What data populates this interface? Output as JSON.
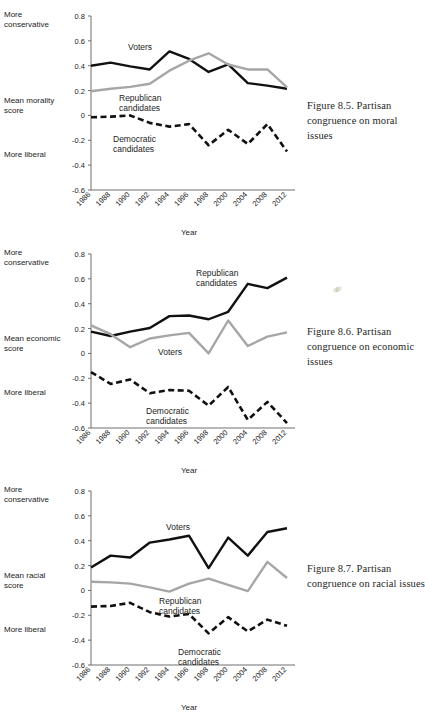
{
  "figures": [
    {
      "id": "figure-8-5",
      "caption": "Figure 8.5.  Partisan congruence on moral issues",
      "axis": {
        "top_label": "More conservative",
        "mid_label": "Mean morality score",
        "bottom_label": "More liberal",
        "x_title": "Year",
        "y_ticks": [
          "0.8",
          "0.6",
          "0.4",
          "0.2",
          "0",
          "-0.2",
          "-0.4",
          "-0.6"
        ]
      },
      "annotations": [
        {
          "text": "Voters"
        },
        {
          "text": "Republican"
        },
        {
          "text": "candidates"
        },
        {
          "text": "Democratic"
        },
        {
          "text": "candidates"
        }
      ],
      "chart_data": {
        "type": "line",
        "title": "Figure 8.5. Partisan congruence on moral issues",
        "xlabel": "Year",
        "ylabel": "Mean morality score",
        "ylim": [
          -0.6,
          0.8
        ],
        "grid": false,
        "legend": "inline-annotations",
        "categories": [
          "1986",
          "1988",
          "1990",
          "1992",
          "1994",
          "1996",
          "1998",
          "2000",
          "2004",
          "2008",
          "2012"
        ],
        "series": [
          {
            "name": "Voters",
            "color": "#111111",
            "style": "solid",
            "values": [
              0.4,
              0.425,
              0.395,
              0.37,
              0.515,
              0.455,
              0.35,
              0.41,
              0.26,
              0.24,
              0.215
            ]
          },
          {
            "name": "Republican candidates",
            "color": "#a6a6a6",
            "style": "solid",
            "values": [
              0.195,
              0.215,
              0.23,
              0.255,
              0.36,
              0.44,
              0.5,
              0.41,
              0.37,
              0.37,
              0.225
            ]
          },
          {
            "name": "Democratic candidates",
            "color": "#111111",
            "style": "dashed",
            "values": [
              -0.015,
              -0.01,
              0.0,
              -0.06,
              -0.09,
              -0.07,
              -0.24,
              -0.115,
              -0.23,
              -0.07,
              -0.29
            ]
          }
        ]
      }
    },
    {
      "id": "figure-8-6",
      "caption": "Figure 8.6.  Partisan congruence on economic issues",
      "axis": {
        "top_label": "More conservative",
        "mid_label": "Mean economic score",
        "bottom_label": "More liberal",
        "x_title": "Year",
        "y_ticks": [
          "0.8",
          "0.6",
          "0.4",
          "0.2",
          "0",
          "-0.2",
          "-0.4",
          "-0.6"
        ]
      },
      "annotations": [
        {
          "text": "Republican"
        },
        {
          "text": "candidates"
        },
        {
          "text": "Voters"
        },
        {
          "text": "Democratic"
        },
        {
          "text": "candidates"
        }
      ],
      "chart_data": {
        "type": "line",
        "title": "Figure 8.6. Partisan congruence on economic issues",
        "xlabel": "Year",
        "ylabel": "Mean economic score",
        "ylim": [
          -0.6,
          0.8
        ],
        "grid": false,
        "legend": "inline-annotations",
        "categories": [
          "1986",
          "1988",
          "1990",
          "1992",
          "1994",
          "1996",
          "1998",
          "2000",
          "2004",
          "2008",
          "2012"
        ],
        "series": [
          {
            "name": "Republican candidates",
            "color": "#111111",
            "style": "solid",
            "values": [
              0.175,
              0.14,
              0.175,
              0.205,
              0.3,
              0.305,
              0.275,
              0.335,
              0.56,
              0.525,
              0.61
            ]
          },
          {
            "name": "Voters",
            "color": "#a6a6a6",
            "style": "solid",
            "values": [
              0.225,
              0.155,
              0.05,
              0.12,
              0.145,
              0.165,
              0.0,
              0.265,
              0.06,
              0.135,
              0.17
            ]
          },
          {
            "name": "Democratic candidates",
            "color": "#111111",
            "style": "dashed",
            "values": [
              -0.15,
              -0.245,
              -0.21,
              -0.32,
              -0.295,
              -0.3,
              -0.42,
              -0.27,
              -0.535,
              -0.39,
              -0.56
            ]
          }
        ]
      }
    },
    {
      "id": "figure-8-7",
      "caption": "Figure 8.7.  Partisan congruence on racial issues",
      "axis": {
        "top_label": "More conservative",
        "mid_label": "Mean racial score",
        "bottom_label": "More liberal",
        "x_title": "Year",
        "y_ticks": [
          "0.8",
          "0.6",
          "0.4",
          "0.2",
          "0",
          "-0.2",
          "-0.4",
          "-0.6"
        ]
      },
      "annotations": [
        {
          "text": "Voters"
        },
        {
          "text": "Republican"
        },
        {
          "text": "candidates"
        },
        {
          "text": "Democratic"
        },
        {
          "text": "candidates"
        }
      ],
      "chart_data": {
        "type": "line",
        "title": "Figure 8.7. Partisan congruence on racial issues",
        "xlabel": "Year",
        "ylabel": "Mean racial score",
        "ylim": [
          -0.6,
          0.8
        ],
        "grid": false,
        "legend": "inline-annotations",
        "categories": [
          "1986",
          "1988",
          "1990",
          "1992",
          "1994",
          "1996",
          "1998",
          "2000",
          "2004",
          "2008",
          "2012"
        ],
        "series": [
          {
            "name": "Voters",
            "color": "#111111",
            "style": "solid",
            "values": [
              0.185,
              0.28,
              0.265,
              0.385,
              0.41,
              0.44,
              0.18,
              0.425,
              0.28,
              0.47,
              0.5
            ]
          },
          {
            "name": "Republican candidates",
            "color": "#a6a6a6",
            "style": "solid",
            "values": [
              0.07,
              0.065,
              0.055,
              0.025,
              -0.01,
              0.055,
              0.095,
              0.045,
              -0.005,
              0.23,
              0.1
            ]
          },
          {
            "name": "Democratic candidates",
            "color": "#111111",
            "style": "dashed",
            "values": [
              -0.13,
              -0.125,
              -0.1,
              -0.175,
              -0.21,
              -0.19,
              -0.345,
              -0.215,
              -0.33,
              -0.235,
              -0.285
            ]
          }
        ]
      }
    }
  ],
  "colors": {
    "black_series": "#111111",
    "gray_series": "#a6a6a6",
    "axis": "#6e6e6e",
    "text": "#1c1c1c",
    "caption_text": "#262626",
    "background": "#ffffff"
  }
}
